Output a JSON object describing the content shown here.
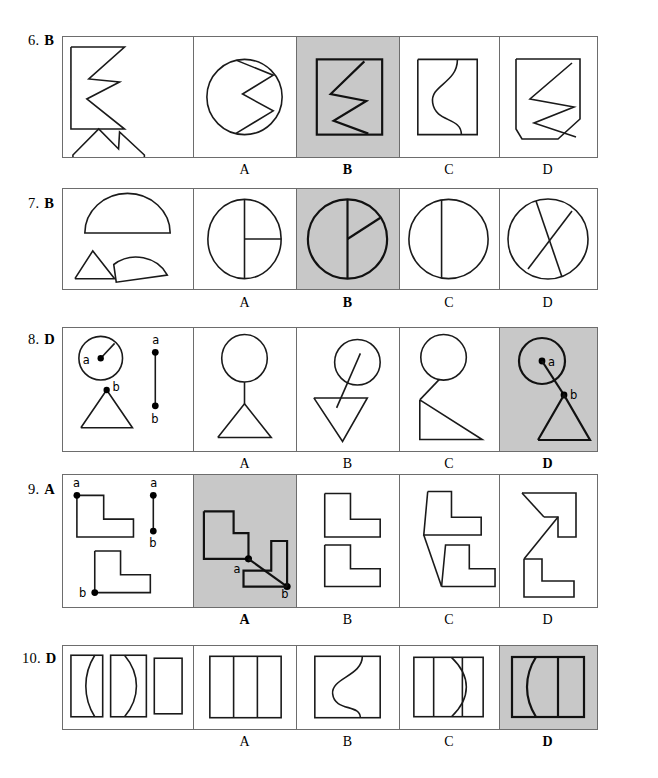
{
  "page": {
    "type": "visual-reasoning-answer-key",
    "width": 658,
    "height": 778,
    "shaded_color": "#c8c8c8",
    "line_color": "#1a1a1a",
    "border_color": "#6d6d6d"
  },
  "option_letters": [
    "A",
    "B",
    "C",
    "D"
  ],
  "questions": [
    {
      "number": "6.",
      "answer": "B",
      "prompt_description": "zigzag-arrow-shape and house-with-notch-shape",
      "options": [
        {
          "letter": "A",
          "correct": false,
          "shaded": false,
          "description": "circle with zigzag chord"
        },
        {
          "letter": "B",
          "correct": true,
          "shaded": true,
          "description": "square with zigzag line"
        },
        {
          "letter": "C",
          "correct": false,
          "shaded": false,
          "description": "square with S-curve"
        },
        {
          "letter": "D",
          "correct": false,
          "shaded": false,
          "description": "pentagon with zigzag line"
        }
      ]
    },
    {
      "number": "7.",
      "answer": "B",
      "prompt_description": "semicircle, quarter circle and triangle",
      "options": [
        {
          "letter": "A",
          "correct": false,
          "shaded": false,
          "description": "circle split vertically and quartered right"
        },
        {
          "letter": "B",
          "correct": true,
          "shaded": true,
          "description": "circle with vertical diameter and radius to upper right"
        },
        {
          "letter": "C",
          "correct": false,
          "shaded": false,
          "description": "circle with one vertical chord"
        },
        {
          "letter": "D",
          "correct": false,
          "shaded": false,
          "description": "circle with two crossing chords"
        }
      ]
    },
    {
      "number": "8.",
      "answer": "D",
      "prompt_description": "circle with point a, triangle with point b, and segment a-b",
      "options": [
        {
          "letter": "A",
          "correct": false,
          "shaded": false,
          "description": "circle above triangle joined by vertical stem"
        },
        {
          "letter": "B",
          "correct": false,
          "shaded": false,
          "description": "circle with line through tilted triangle"
        },
        {
          "letter": "C",
          "correct": false,
          "shaded": false,
          "description": "circle joined to right triangle"
        },
        {
          "letter": "D",
          "correct": true,
          "shaded": true,
          "description": "circle with a at center joined to b at triangle apex"
        }
      ]
    },
    {
      "number": "9.",
      "answer": "A",
      "prompt_description": "two L-shapes with points a and b, and segment a-b",
      "options": [
        {
          "letter": "A",
          "correct": true,
          "shaded": true,
          "description": "two L-shapes joined by diagonal segment a to b"
        },
        {
          "letter": "B",
          "correct": false,
          "shaded": false,
          "description": "two L-shapes stacked touching"
        },
        {
          "letter": "C",
          "correct": false,
          "shaded": false,
          "description": "two L-shapes joined by slanted line"
        },
        {
          "letter": "D",
          "correct": false,
          "shaded": false,
          "description": "two L-shapes joined forming Z"
        }
      ]
    },
    {
      "number": "10.",
      "answer": "D",
      "prompt_description": "rectangle with concave arc, rectangle with convex arc, plain rectangle",
      "options": [
        {
          "letter": "A",
          "correct": false,
          "shaded": false,
          "description": "rectangle divided into three vertical strips"
        },
        {
          "letter": "B",
          "correct": false,
          "shaded": false,
          "description": "rectangle with S-curve"
        },
        {
          "letter": "C",
          "correct": false,
          "shaded": false,
          "description": "rectangle with vertical line and lens arc"
        },
        {
          "letter": "D",
          "correct": true,
          "shaded": true,
          "description": "rectangle with arc and vertical divider"
        }
      ]
    }
  ],
  "point_labels": {
    "a": "a",
    "b": "b"
  }
}
